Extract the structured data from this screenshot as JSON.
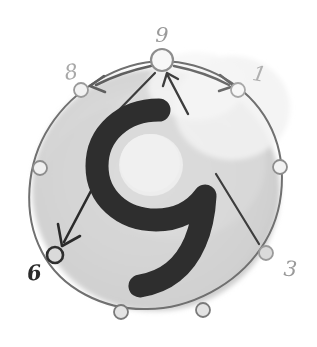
{
  "diagram": {
    "title_glyph": "9",
    "type": "hand-drawn-clock-circle-diagram",
    "colors": {
      "ink_dark": "#2b2b2b",
      "ink_mid": "#5a5a5a",
      "ink_light": "#9a9a9a",
      "ink_faint": "#b3b3b3",
      "disc_fill": "#d6d6d6",
      "background": "#ffffff"
    },
    "center_glyph": {
      "text": "9",
      "color": "#2e2e2e"
    },
    "nodes": [
      {
        "id": "node-9",
        "label": "9",
        "label_color": "#9a9a9a",
        "labeled": true,
        "emphasis": "large",
        "angle_deg": 90,
        "cx": 162,
        "cy": 60,
        "r": 11,
        "stroke": "#8d8d8d",
        "stroke_width": 2.2
      },
      {
        "id": "node-1",
        "label": "1",
        "label_color": "#b0b0b0",
        "labeled": true,
        "emphasis": "normal",
        "angle_deg": 45,
        "cx": 238,
        "cy": 90,
        "r": 7,
        "stroke": "#a8a8a8",
        "stroke_width": 1.8
      },
      {
        "id": "node-2",
        "label": "",
        "label_color": "#b0b0b0",
        "labeled": false,
        "emphasis": "normal",
        "angle_deg": 0,
        "cx": 280,
        "cy": 167,
        "r": 7,
        "stroke": "#8d8d8d",
        "stroke_width": 1.8
      },
      {
        "id": "node-3",
        "label": "3",
        "label_color": "#9a9a9a",
        "labeled": true,
        "emphasis": "normal",
        "angle_deg": -45,
        "cx": 266,
        "cy": 253,
        "r": 7,
        "stroke": "#9a9a9a",
        "stroke_width": 1.8
      },
      {
        "id": "node-4",
        "label": "",
        "label_color": "#b0b0b0",
        "labeled": false,
        "emphasis": "normal",
        "angle_deg": -75,
        "cx": 203,
        "cy": 310,
        "r": 7,
        "stroke": "#7a7a7a",
        "stroke_width": 1.8
      },
      {
        "id": "node-5",
        "label": "",
        "label_color": "#b0b0b0",
        "labeled": false,
        "emphasis": "normal",
        "angle_deg": -105,
        "cx": 121,
        "cy": 312,
        "r": 7,
        "stroke": "#7a7a7a",
        "stroke_width": 1.8
      },
      {
        "id": "node-6",
        "label": "6",
        "label_color": "#2b2b2b",
        "labeled": true,
        "emphasis": "bold",
        "angle_deg": 225,
        "cx": 55,
        "cy": 255,
        "r": 8,
        "stroke": "#2f2f2f",
        "stroke_width": 2.6
      },
      {
        "id": "node-7",
        "label": "",
        "label_color": "#b0b0b0",
        "labeled": false,
        "emphasis": "normal",
        "angle_deg": 180,
        "cx": 40,
        "cy": 168,
        "r": 7,
        "stroke": "#8d8d8d",
        "stroke_width": 1.8
      },
      {
        "id": "node-8",
        "label": "8",
        "label_color": "#a8a8a8",
        "labeled": true,
        "emphasis": "normal",
        "angle_deg": 135,
        "cx": 81,
        "cy": 90,
        "r": 7,
        "stroke": "#9a9a9a",
        "stroke_width": 1.8
      }
    ],
    "labels": [
      {
        "id": "label-9",
        "text": "9",
        "x": 162,
        "y": 35,
        "size": 21,
        "color": "#9a9a9a",
        "rotate": 0
      },
      {
        "id": "label-1",
        "text": "1",
        "x": 258,
        "y": 74,
        "size": 21,
        "color": "#b0b0b0",
        "rotate": 10
      },
      {
        "id": "label-8",
        "text": "8",
        "x": 72,
        "y": 72,
        "size": 21,
        "color": "#a8a8a8",
        "rotate": -8
      },
      {
        "id": "label-3",
        "text": "3",
        "x": 288,
        "y": 269,
        "size": 21,
        "color": "#9a9a9a",
        "rotate": 4
      },
      {
        "id": "label-6",
        "text": "6",
        "x": 37,
        "y": 273,
        "size": 21,
        "color": "#2b2b2b",
        "rotate": -6
      }
    ],
    "arrows": [
      {
        "id": "arrow-top-to-8",
        "kind": "curved",
        "from": "node-9",
        "to": "node-8",
        "arrowhead": true,
        "color": "#5f5f5f"
      },
      {
        "id": "arrow-top-to-1",
        "kind": "curved",
        "from": "node-9",
        "to": "node-1",
        "arrowhead": true,
        "color": "#6a6a6a"
      },
      {
        "id": "arrow-center-to-9",
        "kind": "straight",
        "from": "center",
        "to": "node-9",
        "arrowhead": true,
        "color": "#3d3d3d"
      },
      {
        "id": "line-center-to-9-left",
        "kind": "straight",
        "from": "center",
        "to": "node-9",
        "arrowhead": false,
        "color": "#3d3d3d"
      },
      {
        "id": "arrow-center-to-6",
        "kind": "straight",
        "from": "center",
        "to": "node-6",
        "arrowhead": true,
        "color": "#2b2b2b"
      },
      {
        "id": "line-center-to-3",
        "kind": "straight",
        "from": "center",
        "to": "node-3",
        "arrowhead": false,
        "color": "#3d3d3d"
      }
    ],
    "disc": {
      "cx": 160,
      "cy": 187,
      "r": 122,
      "stroke": "#6e6e6e",
      "stroke_width": 2.0,
      "fill": "#d6d6d6"
    }
  }
}
